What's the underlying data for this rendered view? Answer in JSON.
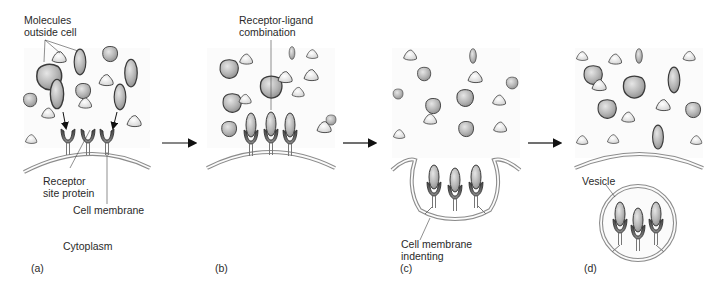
{
  "panels": [
    {
      "id": "a",
      "label": "(a)",
      "annotations": {
        "molecules": "Molecules\noutside cell",
        "receptor": "Receptor\nsite protein",
        "membrane": "Cell membrane",
        "cytoplasm": "Cytoplasm"
      }
    },
    {
      "id": "b",
      "label": "(b)",
      "annotations": {
        "combination": "Receptor-ligand\ncombination"
      }
    },
    {
      "id": "c",
      "label": "(c)",
      "annotations": {
        "indenting": "Cell membrane\nindenting"
      }
    },
    {
      "id": "d",
      "label": "(d)",
      "annotations": {
        "vesicle": "Vesicle"
      }
    }
  ],
  "colors": {
    "molecule_fill": "#b9b9b9",
    "molecule_light": "#e4e4e4",
    "outline": "#3a3a3a",
    "membrane": "#8c8c8c",
    "receptor_dark": "#5a5a5a"
  }
}
